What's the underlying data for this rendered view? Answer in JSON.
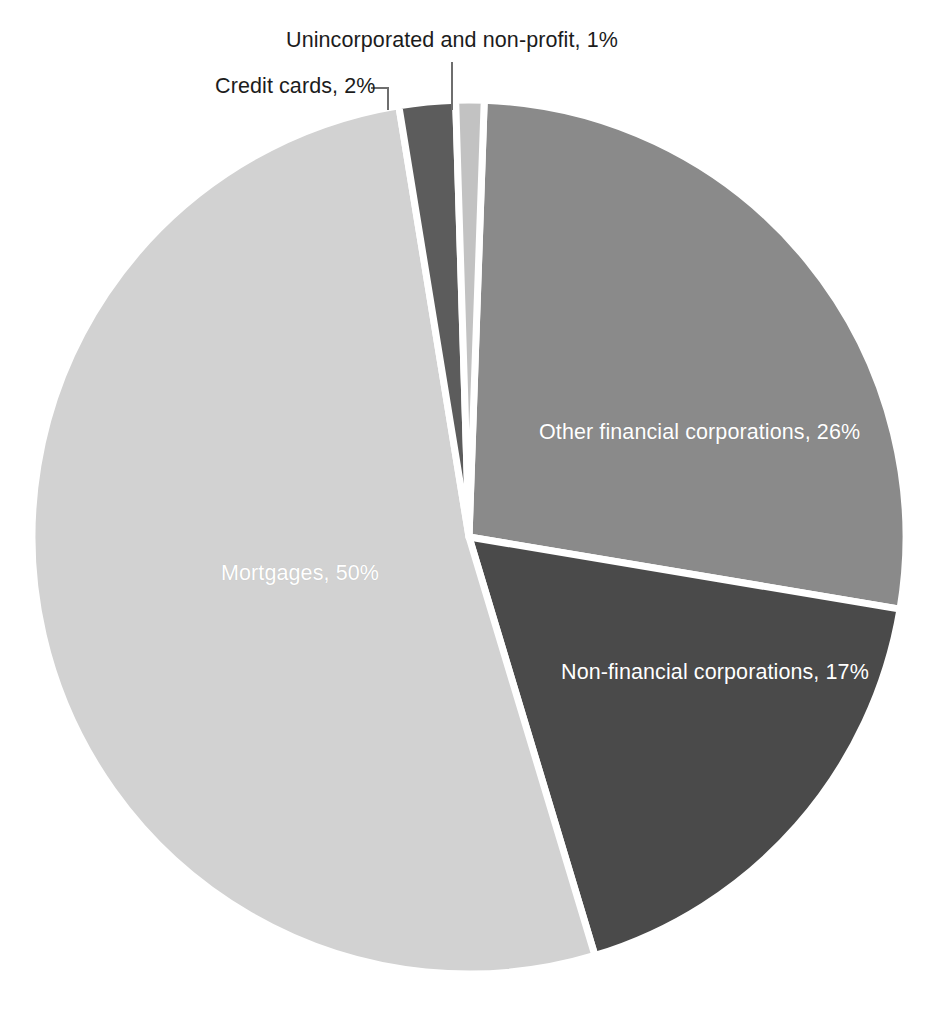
{
  "chart_data": {
    "type": "pie",
    "title": "",
    "subtitle": "",
    "xlabel": "",
    "ylabel": "",
    "legend_position": "none",
    "grid": false,
    "value_unit": "percent",
    "categories": [
      "Other financial corporations",
      "Non-financial corporations",
      "Mortgages",
      "Credit cards",
      "Unincorporated and non-profit"
    ],
    "values": [
      26,
      17,
      50,
      2,
      1
    ],
    "slices": [
      {
        "name": "Other financial corporations",
        "value": 26,
        "label": "Other financial corporations, 26%",
        "color": "#8a8a8a",
        "label_placement": "inside",
        "label_color": "#ffffff"
      },
      {
        "name": "Non-financial corporations",
        "value": 17,
        "label": "Non-financial corporations, 17%",
        "color": "#4a4a4a",
        "label_placement": "inside",
        "label_color": "#ffffff"
      },
      {
        "name": "Mortgages",
        "value": 50,
        "label": "Mortgages, 50%",
        "color": "#d2d2d2",
        "label_placement": "inside",
        "label_color": "#ffffff"
      },
      {
        "name": "Credit cards",
        "value": 2,
        "label": "Credit cards, 2%",
        "color": "#5c5c5c",
        "label_placement": "outside",
        "label_color": "#1c1c1c"
      },
      {
        "name": "Unincorporated and non-profit",
        "value": 1,
        "label": "Unincorporated and non-profit, 1%",
        "color": "#c2c2c2",
        "label_placement": "outside",
        "label_color": "#1c1c1c"
      }
    ]
  },
  "labels": {
    "unincorporated": "Unincorporated and non-profit, 1%",
    "credit_cards": "Credit cards, 2%",
    "other_financial": "Other financial corporations, 26%",
    "non_financial": "Non-financial corporations, 17%",
    "mortgages": "Mortgages, 50%"
  },
  "colors": {
    "background": "#ffffff",
    "slice_other_financial": "#8a8a8a",
    "slice_non_financial": "#4a4a4a",
    "slice_mortgages": "#d2d2d2",
    "slice_credit_cards": "#5c5c5c",
    "slice_unincorporated": "#c2c2c2",
    "separator": "#ffffff",
    "leader_line": "#6e6e6e",
    "outside_label_text": "#1c1c1c",
    "inside_label_text": "#ffffff"
  }
}
